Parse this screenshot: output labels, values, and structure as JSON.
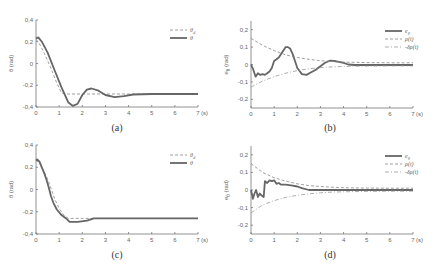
{
  "chart_data": [
    {
      "id": "a",
      "type": "line",
      "caption": "(a)",
      "ylabel": "θ (rad)",
      "xlabel": "(s)",
      "xlim": [
        0,
        7
      ],
      "ylim": [
        -0.4,
        0.4
      ],
      "xticks": [
        "0",
        "1",
        "2",
        "3",
        "4",
        "5",
        "6",
        "7"
      ],
      "yticks": [
        "0.4",
        "0.2",
        "0",
        "-0.2",
        "-0.4"
      ],
      "legend": [
        "θ_d",
        "θ"
      ],
      "series": [
        {
          "name": "θ_d",
          "style": "dashed",
          "x": [
            0,
            0.1,
            0.3,
            0.6,
            0.9,
            1.1,
            1.3,
            2,
            3,
            4,
            5,
            6,
            7
          ],
          "y": [
            0.22,
            0.2,
            0.12,
            -0.02,
            -0.18,
            -0.27,
            -0.28,
            -0.28,
            -0.28,
            -0.28,
            -0.28,
            -0.28,
            -0.28
          ]
        },
        {
          "name": "θ",
          "style": "solid",
          "x": [
            0,
            0.1,
            0.25,
            0.5,
            0.8,
            1.1,
            1.4,
            1.6,
            1.8,
            2.0,
            2.2,
            2.4,
            2.7,
            3.0,
            3.4,
            3.8,
            4.2,
            5,
            6,
            7
          ],
          "y": [
            0.23,
            0.24,
            0.2,
            0.1,
            -0.06,
            -0.22,
            -0.36,
            -0.39,
            -0.37,
            -0.29,
            -0.24,
            -0.23,
            -0.25,
            -0.29,
            -0.31,
            -0.3,
            -0.285,
            -0.28,
            -0.28,
            -0.28
          ]
        }
      ]
    },
    {
      "id": "b",
      "type": "line",
      "caption": "(b)",
      "ylabel": "e_θ (rad)",
      "xlabel": "(s)",
      "xlim": [
        0,
        7
      ],
      "ylim": [
        -0.25,
        0.25
      ],
      "xticks": [
        "0",
        "1",
        "2",
        "3",
        "4",
        "5",
        "6",
        "7"
      ],
      "yticks": [
        "0.2",
        "0.1",
        "0",
        "-0.1",
        "-0.2"
      ],
      "legend": [
        "e_θ",
        "ρ(t)",
        "-δρ(t)"
      ],
      "series": [
        {
          "name": "e_θ",
          "style": "solid",
          "x": [
            0,
            0.1,
            0.2,
            0.3,
            0.4,
            0.5,
            0.6,
            0.7,
            0.8,
            0.9,
            1.0,
            1.1,
            1.2,
            1.3,
            1.4,
            1.5,
            1.6,
            1.7,
            1.8,
            1.9,
            2.0,
            2.2,
            2.4,
            2.6,
            2.8,
            3.0,
            3.2,
            3.4,
            3.6,
            3.8,
            4.0,
            4.2,
            4.5,
            5,
            6,
            7
          ],
          "y": [
            0.0,
            -0.03,
            -0.07,
            -0.05,
            -0.06,
            -0.055,
            -0.06,
            -0.05,
            -0.04,
            -0.02,
            0.02,
            0.03,
            0.04,
            0.06,
            0.08,
            0.1,
            0.1,
            0.09,
            0.06,
            0.02,
            -0.02,
            -0.055,
            -0.06,
            -0.045,
            -0.03,
            -0.01,
            0.01,
            0.022,
            0.02,
            0.015,
            0.01,
            0.0,
            -0.003,
            -0.003,
            -0.003,
            -0.003
          ]
        },
        {
          "name": "ρ(t)",
          "style": "dashed",
          "x": [
            0,
            0.5,
            1,
            1.5,
            2,
            2.5,
            3,
            3.5,
            4,
            5,
            6,
            7
          ],
          "y": [
            0.15,
            0.11,
            0.08,
            0.055,
            0.04,
            0.03,
            0.022,
            0.017,
            0.014,
            0.011,
            0.01,
            0.01
          ]
        },
        {
          "name": "-δρ(t)",
          "style": "dash-dot",
          "x": [
            0,
            0.5,
            1,
            1.5,
            2,
            2.5,
            3,
            3.5,
            4,
            5,
            6,
            7
          ],
          "y": [
            -0.13,
            -0.095,
            -0.07,
            -0.05,
            -0.035,
            -0.025,
            -0.018,
            -0.014,
            -0.011,
            -0.009,
            -0.008,
            -0.008
          ]
        }
      ]
    },
    {
      "id": "c",
      "type": "line",
      "caption": "(c)",
      "ylabel": "θ (rad)",
      "xlabel": "(s)",
      "xlim": [
        0,
        7
      ],
      "ylim": [
        -0.4,
        0.4
      ],
      "xticks": [
        "0",
        "1",
        "2",
        "3",
        "4",
        "5",
        "6",
        "7"
      ],
      "yticks": [
        "0.4",
        "0.2",
        "0",
        "-0.2",
        "-0.4"
      ],
      "legend": [
        "θ_d",
        "θ"
      ],
      "series": [
        {
          "name": "θ_d",
          "style": "dashed",
          "x": [
            0,
            0.1,
            0.2,
            0.4,
            0.6,
            0.8,
            1.0,
            1.2,
            1.4,
            2,
            3,
            4,
            5,
            6,
            7
          ],
          "y": [
            0.26,
            0.25,
            0.22,
            0.14,
            0.04,
            -0.08,
            -0.17,
            -0.23,
            -0.26,
            -0.26,
            -0.26,
            -0.26,
            -0.26,
            -0.26,
            -0.26
          ]
        },
        {
          "name": "θ",
          "style": "solid",
          "x": [
            0,
            0.05,
            0.15,
            0.25,
            0.35,
            0.45,
            0.55,
            0.65,
            0.75,
            0.9,
            1.1,
            1.3,
            1.45,
            1.8,
            2.2,
            2.5,
            3,
            4,
            5,
            6,
            7
          ],
          "y": [
            0.26,
            0.27,
            0.25,
            0.2,
            0.15,
            0.09,
            0.02,
            -0.06,
            -0.12,
            -0.18,
            -0.23,
            -0.26,
            -0.29,
            -0.29,
            -0.28,
            -0.26,
            -0.26,
            -0.26,
            -0.26,
            -0.26,
            -0.26
          ]
        }
      ]
    },
    {
      "id": "d",
      "type": "line",
      "caption": "(d)",
      "ylabel": "e_θ (rad)",
      "xlabel": "(s)",
      "xlim": [
        0,
        7
      ],
      "ylim": [
        -0.25,
        0.25
      ],
      "xticks": [
        "0",
        "1",
        "2",
        "3",
        "4",
        "5",
        "6",
        "7"
      ],
      "yticks": [
        "0.2",
        "0.1",
        "0",
        "-0.1",
        "-0.2"
      ],
      "legend": [
        "e_θ",
        "ρ(t)",
        "-δρ(t)"
      ],
      "series": [
        {
          "name": "e_θ",
          "style": "solid",
          "x": [
            0,
            0.08,
            0.15,
            0.22,
            0.3,
            0.38,
            0.45,
            0.55,
            0.6,
            0.7,
            0.8,
            0.9,
            1.0,
            1.1,
            1.2,
            1.3,
            1.5,
            1.8,
            2.0,
            2.2,
            2.5,
            3,
            4,
            5,
            6,
            7
          ],
          "y": [
            0.0,
            -0.05,
            -0.02,
            0.0,
            -0.04,
            -0.02,
            -0.03,
            -0.04,
            0.05,
            0.04,
            0.055,
            0.05,
            0.055,
            0.035,
            0.04,
            0.03,
            0.03,
            0.025,
            0.02,
            0.01,
            0.0,
            0.0,
            0.0,
            0.0,
            0.0,
            0.0
          ]
        },
        {
          "name": "ρ(t)",
          "style": "dashed",
          "x": [
            0,
            0.5,
            1,
            1.5,
            2,
            2.5,
            3,
            3.5,
            4,
            5,
            6,
            7
          ],
          "y": [
            0.15,
            0.1,
            0.07,
            0.05,
            0.035,
            0.025,
            0.02,
            0.016,
            0.013,
            0.011,
            0.01,
            0.01
          ]
        },
        {
          "name": "-δρ(t)",
          "style": "dash-dot",
          "x": [
            0,
            0.5,
            1,
            1.5,
            2,
            2.5,
            3,
            3.5,
            4,
            5,
            6,
            7
          ],
          "y": [
            -0.13,
            -0.085,
            -0.06,
            -0.042,
            -0.03,
            -0.022,
            -0.016,
            -0.012,
            -0.01,
            -0.008,
            -0.007,
            -0.007
          ]
        }
      ]
    }
  ]
}
